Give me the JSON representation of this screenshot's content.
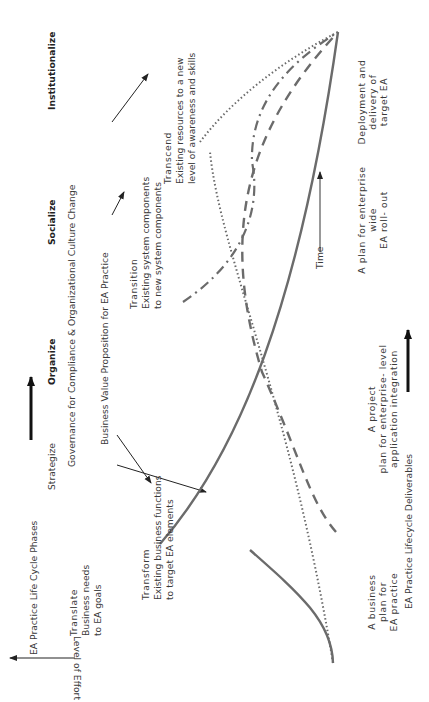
{
  "header": {
    "lifecycle_label": "EA Practice Life Cycle Phases",
    "phases": [
      "Strategize",
      "Organize",
      "Socialize",
      "Institutionalize"
    ],
    "governance_label": "Governance for Compliance & Organizational Culture Change",
    "value_prop_label": "Business Value Proposition for EA Practice"
  },
  "axes": {
    "y_label": "Level of Effort",
    "x_label": "Time"
  },
  "stages": {
    "translate": {
      "title": "Translate",
      "line1": "Business needs",
      "line2": "to EA goals"
    },
    "transform": {
      "title": "Transform",
      "line1": "Existing business functions",
      "line2": "to target EA elements"
    },
    "transition": {
      "title": "Transition",
      "line1": "Existing system components",
      "line2": "to new system components"
    },
    "transcend": {
      "title": "Transcend",
      "line1": "Existing resources to a new",
      "line2": "level of awareness and skills"
    }
  },
  "deliverables": {
    "label": "EA Practice Lifecycle Deliverables",
    "items": [
      {
        "l1": "A business",
        "l2": "plan for",
        "l3": "EA practice"
      },
      {
        "l1": "A project",
        "l2": "plan for enterprise- level",
        "l3": "application integration"
      },
      {
        "l1": "A plan for enterprise",
        "l2": "wide",
        "l3": "EA roll- out"
      },
      {
        "l1": "Deployment and",
        "l2": "delivery of",
        "l3": "target EA"
      }
    ]
  },
  "colors": {
    "curve": "#6b6b6b",
    "arrow": "#222222",
    "text": "#3a3a3a"
  }
}
